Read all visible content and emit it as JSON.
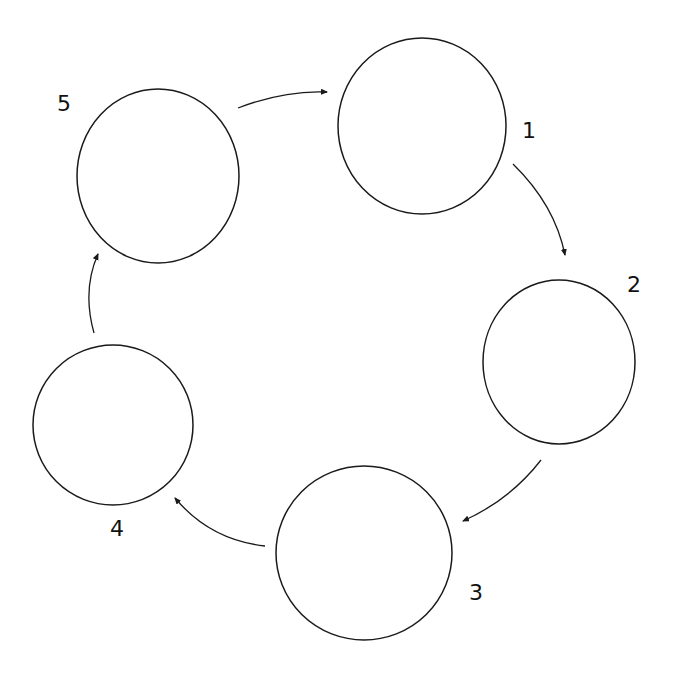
{
  "diagram": {
    "type": "cycle",
    "nodes": [
      {
        "id": "1",
        "label": "1",
        "cx": 422,
        "cy": 126,
        "rx": 84,
        "ry": 88,
        "lx": 522,
        "ly": 138
      },
      {
        "id": "2",
        "label": "2",
        "cx": 559,
        "cy": 362,
        "rx": 76,
        "ry": 82,
        "lx": 627,
        "ly": 292
      },
      {
        "id": "3",
        "label": "3",
        "cx": 364,
        "cy": 553,
        "rx": 88,
        "ry": 87,
        "lx": 469,
        "ly": 600
      },
      {
        "id": "4",
        "label": "4",
        "cx": 113,
        "cy": 425,
        "rx": 80,
        "ry": 80,
        "lx": 110,
        "ly": 536
      },
      {
        "id": "5",
        "label": "5",
        "cx": 158,
        "cy": 176,
        "rx": 81,
        "ry": 87,
        "lx": 57,
        "ly": 111
      }
    ],
    "edges": [
      {
        "from": "5",
        "to": "1",
        "path": "M238,108 Q285,90 327,92"
      },
      {
        "from": "1",
        "to": "2",
        "path": "M513,164 Q555,205 565,255"
      },
      {
        "from": "2",
        "to": "3",
        "path": "M541,460 Q510,500 463,521"
      },
      {
        "from": "3",
        "to": "4",
        "path": "M265,546 Q210,540 175,498"
      },
      {
        "from": "4",
        "to": "5",
        "path": "M94,333 Q82,290 98,254"
      }
    ],
    "colors": {
      "stroke": "#1a1a1a",
      "background": "#ffffff"
    }
  }
}
